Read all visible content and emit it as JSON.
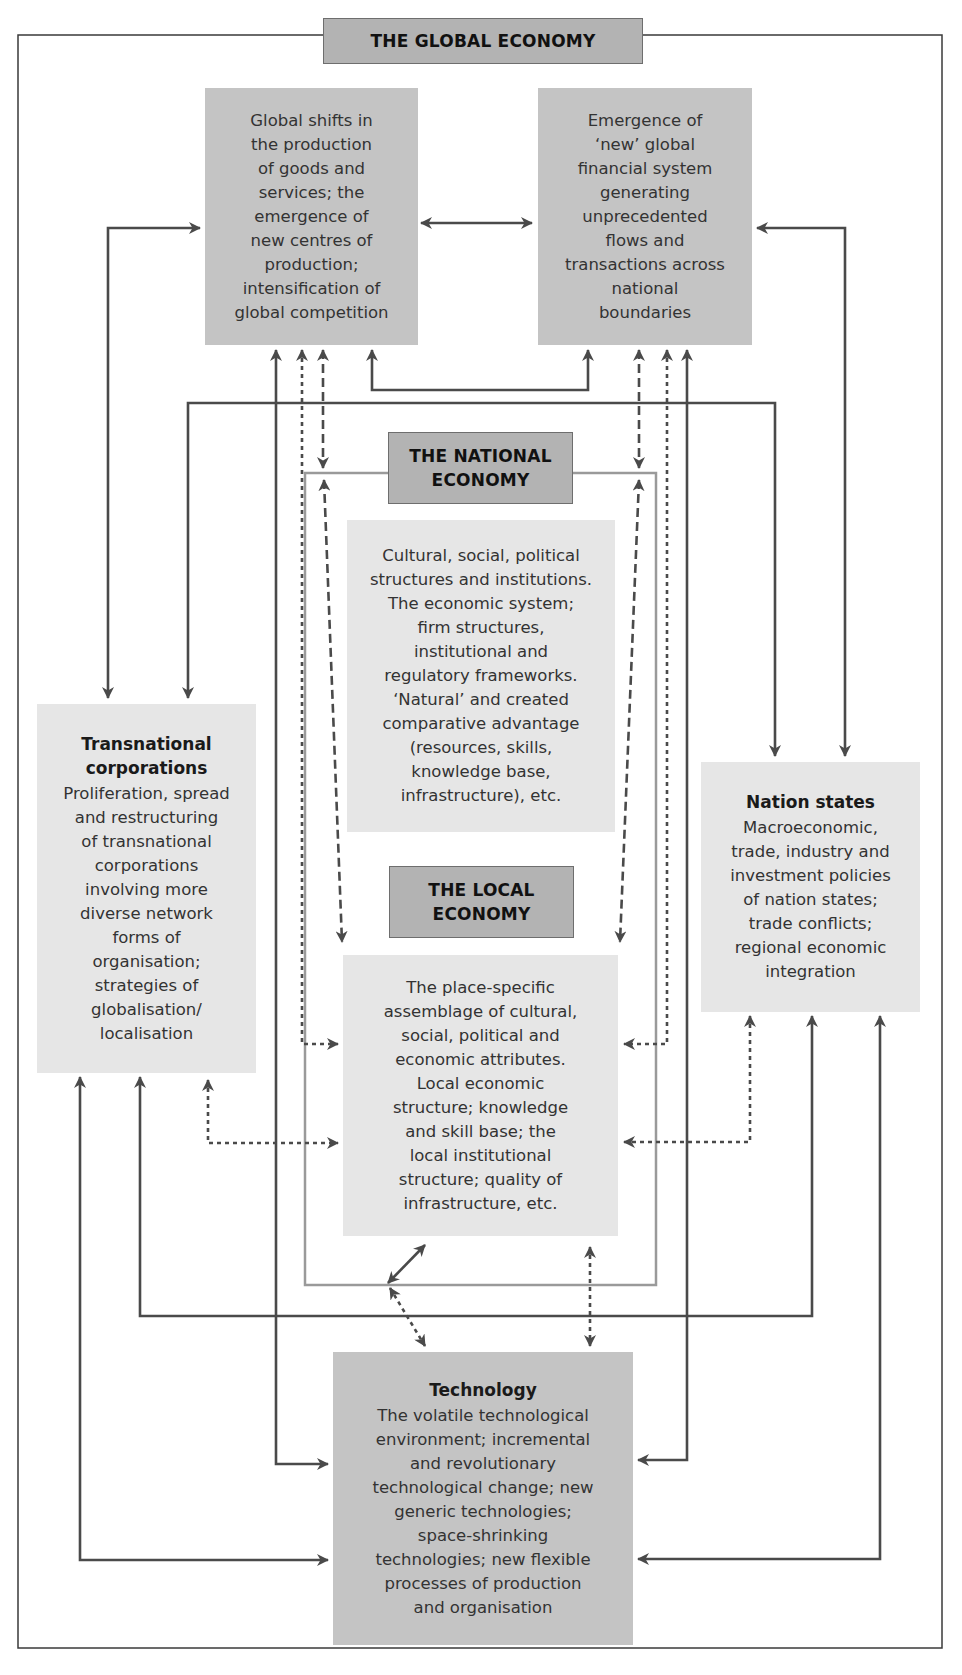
{
  "diagram": {
    "title": "THE GLOBAL ECONOMY",
    "colors": {
      "line": "#4a4a4a",
      "national_frame": "#9a9a9a",
      "title_box": "#b3b3b3",
      "global_box": "#c4c4c4",
      "inner_box": "#e6e6e6"
    },
    "global_boxes": [
      {
        "id": "production",
        "text": "Global shifts in\nthe production\nof goods and\nservices; the\nemergence of\nnew centres of\nproduction;\nintensification of\nglobal competition"
      },
      {
        "id": "finance",
        "text": "Emergence of\n‘new’ global\nfinancial system\ngenerating\nunprecedented\nflows and\ntransactions across\nnational\nboundaries"
      }
    ],
    "national": {
      "title": "THE NATIONAL\nECONOMY",
      "text": "Cultural, social, political\nstructures and institutions.\nThe economic system;\nfirm structures,\ninstitutional and\nregulatory frameworks.\n‘Natural’ and created\ncomparative advantage\n(resources, skills,\nknowledge base,\ninfrastructure), etc."
    },
    "local": {
      "title": "THE LOCAL\nECONOMY",
      "text": "The place-specific\nassemblage of cultural,\nsocial, political and\neconomic attributes.\nLocal economic\nstructure; knowledge\nand skill base; the\nlocal institutional\nstructure; quality of\ninfrastructure, etc."
    },
    "tnc": {
      "heading": "Transnational\ncorporations",
      "text": "Proliferation, spread\nand restructuring\nof transnational\ncorporations\ninvolving more\ndiverse network\nforms of\norganisation;\nstrategies of\nglobalisation/\nlocalisation"
    },
    "nation_states": {
      "heading": "Nation states",
      "text": "Macroeconomic,\ntrade, industry and\ninvestment policies\nof nation states;\ntrade conflicts;\nregional economic\nintegration"
    },
    "technology": {
      "heading": "Technology",
      "text": "The volatile technological\nenvironment; incremental\nand revolutionary\ntechnological change; new\ngeneric technologies;\nspace-shrinking\ntechnologies; new flexible\nprocesses of production\nand organisation"
    },
    "connectors": {
      "solid": "direct relationship",
      "dashed": "national-level link",
      "dotted": "local-level link"
    }
  }
}
